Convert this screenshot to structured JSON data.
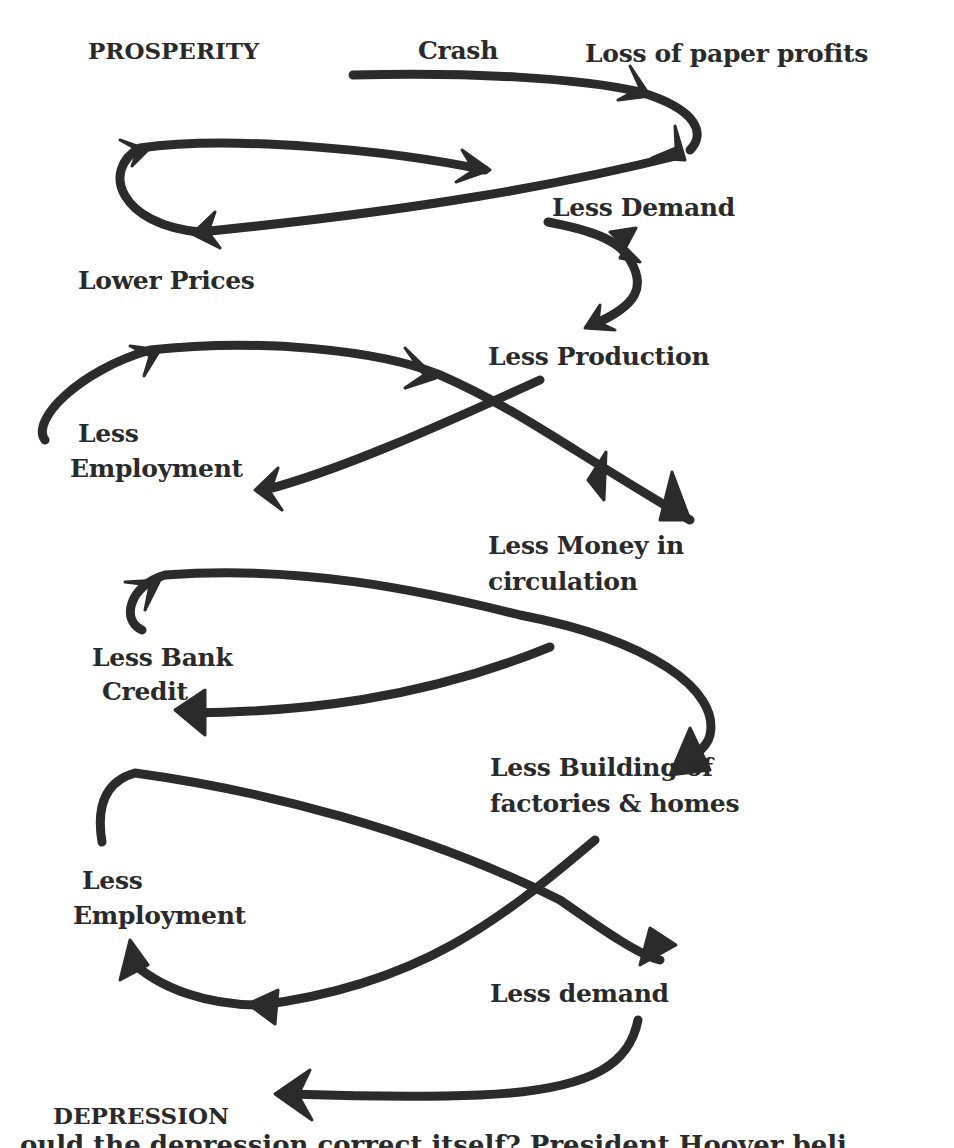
{
  "diagram": {
    "type": "flow",
    "nodes": [
      {
        "id": "prosperity",
        "label": "PROSPERITY"
      },
      {
        "id": "crash",
        "label": "Crash"
      },
      {
        "id": "loss_paper_profits",
        "label": "Loss of paper profits"
      },
      {
        "id": "less_demand_1",
        "label": "Less Demand"
      },
      {
        "id": "lower_prices",
        "label": "Lower Prices"
      },
      {
        "id": "less_production",
        "label": "Less Production"
      },
      {
        "id": "less_employment_1",
        "label_line1": "Less",
        "label_line2": "Employment"
      },
      {
        "id": "less_money",
        "label_line1": "Less Money in",
        "label_line2": "circulation"
      },
      {
        "id": "less_bank_credit",
        "label_line1": "Less Bank",
        "label_line2": "Credit"
      },
      {
        "id": "less_building",
        "label_line1": "Less Building of",
        "label_line2": "factories & homes"
      },
      {
        "id": "less_employment_2",
        "label_line1": "Less",
        "label_line2": "Employment"
      },
      {
        "id": "less_demand_2",
        "label": "Less demand"
      },
      {
        "id": "depression",
        "label": "DEPRESSION"
      }
    ],
    "edges": [
      {
        "from": "crash",
        "to": "loss_paper_profits"
      },
      {
        "from": "loss_paper_profits",
        "to": "less_demand_1"
      },
      {
        "from": "less_demand_1",
        "to": "lower_prices"
      },
      {
        "from": "lower_prices",
        "to": "less_demand_1"
      },
      {
        "from": "less_demand_1",
        "to": "less_production"
      },
      {
        "from": "less_production",
        "to": "less_employment_1"
      },
      {
        "from": "less_employment_1",
        "to": "less_money"
      },
      {
        "from": "less_money",
        "to": "less_bank_credit"
      },
      {
        "from": "less_bank_credit",
        "to": "less_building"
      },
      {
        "from": "less_building",
        "to": "less_employment_2"
      },
      {
        "from": "less_employment_2",
        "to": "less_demand_2"
      },
      {
        "from": "less_demand_2",
        "to": "depression"
      }
    ],
    "stroke_color": "#2b2b2b",
    "text_color": "#2a2a2a"
  },
  "footer": {
    "partial_text": "ould the depression correct itself? President Hoover beli"
  }
}
